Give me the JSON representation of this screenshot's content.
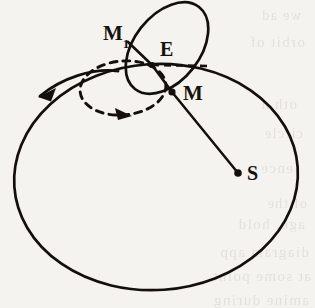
{
  "figure": {
    "name": "orbital-epicycle-diagram",
    "background_color": "#f4f3f0",
    "ink_color": "#14110e",
    "labels": [
      {
        "id": "m1",
        "text": "M",
        "subscript": "1",
        "x": 103,
        "y": 40
      },
      {
        "id": "e",
        "text": "E",
        "subscript": "",
        "x": 160,
        "y": 56
      },
      {
        "id": "m",
        "text": "M",
        "subscript": "",
        "x": 183,
        "y": 100
      },
      {
        "id": "s",
        "text": "S",
        "subscript": "",
        "x": 247,
        "y": 180
      }
    ],
    "points": [
      {
        "id": "point-m1",
        "x": 128,
        "y": 42,
        "radius": 0
      },
      {
        "id": "point-e",
        "x": 152,
        "y": 65,
        "radius": 3.1
      },
      {
        "id": "point-m",
        "x": 172,
        "y": 92,
        "radius": 3.6
      },
      {
        "id": "point-s",
        "x": 238,
        "y": 173,
        "radius": 3.8
      }
    ],
    "orbit": {
      "name": "large-orbit-circle",
      "cx": 156,
      "cy": 177,
      "rx": 142,
      "ry": 113,
      "rotation": -4
    },
    "epicycle": {
      "name": "epicycle-loop",
      "cx": 167,
      "cy": 48,
      "rx": 33,
      "ry": 52,
      "rotation": 38
    },
    "dashed_loop": {
      "name": "dashed-motion-loop",
      "cx": 123,
      "cy": 88,
      "rx": 43,
      "ry": 27,
      "rotation": -5
    },
    "dashed_sightline": {
      "name": "dashed-sight-line",
      "x1": 152,
      "y1": 65,
      "x2": 207,
      "y2": 66
    },
    "radius_line": {
      "name": "radius-line-m-to-s",
      "x1": 172,
      "y1": 92,
      "x2": 238,
      "y2": 173
    },
    "chord_m1_e_m": {
      "name": "chord-m1-e-m",
      "points": "128,42 152,65 172,92"
    },
    "direction_arrow": {
      "name": "direction-of-motion-arrow",
      "path": "M 118 71 C 92 68 62 78 40 96",
      "tip_x": 38,
      "tip_y": 97
    },
    "loop_arrow_tip": {
      "name": "dashed-loop-arrowhead",
      "tip_x": 132,
      "tip_y": 116
    }
  },
  "bleed_text": {
    "lines": [
      {
        "text": "we ad",
        "x": 14,
        "y": 8,
        "size": 14
      },
      {
        "text": "orbit of",
        "x": 10,
        "y": 34,
        "size": 15
      },
      {
        "text": "oth a",
        "x": 18,
        "y": 96,
        "size": 15
      },
      {
        "text": "circle",
        "x": 12,
        "y": 126,
        "size": 14
      },
      {
        "text": "ence",
        "x": 22,
        "y": 160,
        "size": 15
      },
      {
        "text": "of the",
        "x": 8,
        "y": 196,
        "size": 14
      },
      {
        "text": "age, hold",
        "x": 10,
        "y": 216,
        "size": 15
      },
      {
        "text": "diagram app",
        "x": 6,
        "y": 244,
        "size": 15
      },
      {
        "text": "at some point",
        "x": 4,
        "y": 268,
        "size": 15
      },
      {
        "text": "amine during",
        "x": 6,
        "y": 292,
        "size": 15
      }
    ]
  }
}
